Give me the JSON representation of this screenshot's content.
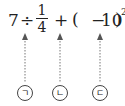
{
  "expression": {
    "seven": "7",
    "divide": "÷",
    "frac_num": "1",
    "frac_den": "4",
    "plus": "+",
    "lparen": "(",
    "minus": "−",
    "ten": "10",
    "rparen": ")",
    "exponent": "2"
  },
  "labels": [
    {
      "text": "ㄱ",
      "target": "÷"
    },
    {
      "text": "ㄴ",
      "target": "+"
    },
    {
      "text": "ㄷ",
      "target": "−"
    }
  ]
}
